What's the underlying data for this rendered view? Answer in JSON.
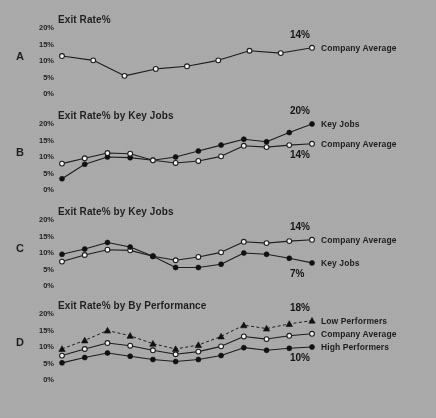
{
  "figure": {
    "background_color": "#a9a9a9",
    "ink_color": "#1d1d1d",
    "marker_open_fill": "#f2f2f2",
    "marker_solid_fill": "#101010"
  },
  "axis": {
    "ticks": [
      "20%",
      "15%",
      "10%",
      "5%",
      "0%"
    ],
    "ymin": 0,
    "ymax": 20
  },
  "panels": [
    {
      "letter": "A",
      "title": "Exit Rate%",
      "series_labels": [
        "Company Average"
      ],
      "end_values": [
        "14%"
      ]
    },
    {
      "letter": "B",
      "title": "Exit Rate% by Key Jobs",
      "series_labels": [
        "Key Jobs",
        "Company Average"
      ],
      "end_values": [
        "20%",
        "14%"
      ]
    },
    {
      "letter": "C",
      "title": "Exit Rate% by Key Jobs",
      "series_labels": [
        "Company Average",
        "Key Jobs"
      ],
      "end_values": [
        "14%",
        "7%"
      ]
    },
    {
      "letter": "D",
      "title": "Exit Rate% by By Performance",
      "series_labels": [
        "Low Performers",
        "Company Average",
        "High Performers"
      ],
      "end_values": [
        "18%",
        "10%"
      ]
    }
  ],
  "chart_data": [
    {
      "type": "line",
      "panel": "A",
      "title": "Exit Rate%",
      "xlabel": "",
      "ylabel": "Exit Rate%",
      "ylim": [
        0,
        20
      ],
      "yticks": [
        0,
        5,
        10,
        15,
        20
      ],
      "ytick_labels": [
        "0%",
        "5%",
        "10%",
        "15%",
        "20%"
      ],
      "grid": false,
      "legend_position": "right-inline",
      "x": [
        1,
        2,
        3,
        4,
        5,
        6,
        7,
        8,
        9
      ],
      "series": [
        {
          "name": "Company Average",
          "marker": "open-circle",
          "line_style": "solid",
          "end_label": "14%",
          "values": [
            11.5,
            10.2,
            5.5,
            7.6,
            8.4,
            10.2,
            13.1,
            12.4,
            14.0
          ]
        }
      ]
    },
    {
      "type": "line",
      "panel": "B",
      "title": "Exit Rate% by Key Jobs",
      "xlabel": "",
      "ylabel": "Exit Rate%",
      "ylim": [
        0,
        20
      ],
      "yticks": [
        0,
        5,
        10,
        15,
        20
      ],
      "ytick_labels": [
        "0%",
        "5%",
        "10%",
        "15%",
        "20%"
      ],
      "grid": false,
      "legend_position": "right-inline",
      "x": [
        1,
        2,
        3,
        4,
        5,
        6,
        7,
        8,
        9,
        10,
        11,
        12
      ],
      "series": [
        {
          "name": "Key Jobs",
          "marker": "solid-circle",
          "line_style": "solid",
          "end_label": "20%",
          "values": [
            3.4,
            7.8,
            10.0,
            9.8,
            9.0,
            10.0,
            11.8,
            13.6,
            15.4,
            14.6,
            17.4,
            20.0
          ]
        },
        {
          "name": "Company Average",
          "marker": "open-circle",
          "line_style": "solid",
          "end_label": "14%",
          "values": [
            8.0,
            9.6,
            11.2,
            11.0,
            9.0,
            8.2,
            8.8,
            10.2,
            13.4,
            13.0,
            13.6,
            14.0
          ]
        }
      ]
    },
    {
      "type": "line",
      "panel": "C",
      "title": "Exit Rate% by Key Jobs",
      "xlabel": "",
      "ylabel": "Exit Rate%",
      "ylim": [
        0,
        20
      ],
      "yticks": [
        0,
        5,
        10,
        15,
        20
      ],
      "ytick_labels": [
        "0%",
        "5%",
        "10%",
        "15%",
        "20%"
      ],
      "grid": false,
      "legend_position": "right-inline",
      "x": [
        1,
        2,
        3,
        4,
        5,
        6,
        7,
        8,
        9,
        10,
        11,
        12
      ],
      "series": [
        {
          "name": "Company Average",
          "marker": "open-circle",
          "line_style": "solid",
          "end_label": "14%",
          "values": [
            7.4,
            9.4,
            11.0,
            10.8,
            9.0,
            7.8,
            8.8,
            10.2,
            13.4,
            13.0,
            13.6,
            14.0
          ]
        },
        {
          "name": "Key Jobs",
          "marker": "solid-circle",
          "line_style": "solid",
          "end_label": "7%",
          "values": [
            9.6,
            11.2,
            13.2,
            11.8,
            9.0,
            5.6,
            5.6,
            6.6,
            10.0,
            9.6,
            8.4,
            7.0
          ]
        }
      ]
    },
    {
      "type": "line",
      "panel": "D",
      "title": "Exit Rate% by By Performance",
      "xlabel": "",
      "ylabel": "Exit Rate%",
      "ylim": [
        0,
        20
      ],
      "yticks": [
        0,
        5,
        10,
        15,
        20
      ],
      "ytick_labels": [
        "0%",
        "5%",
        "10%",
        "15%",
        "20%"
      ],
      "grid": false,
      "legend_position": "right-inline",
      "x": [
        1,
        2,
        3,
        4,
        5,
        6,
        7,
        8,
        9,
        10,
        11,
        12
      ],
      "series": [
        {
          "name": "Low Performers",
          "marker": "solid-triangle",
          "line_style": "dashed",
          "end_label": "18%",
          "values": [
            9.4,
            12.0,
            15.0,
            13.4,
            11.0,
            9.4,
            10.6,
            13.2,
            16.6,
            15.6,
            17.0,
            18.0
          ]
        },
        {
          "name": "Company Average",
          "marker": "open-circle",
          "line_style": "solid",
          "end_label": "",
          "values": [
            7.4,
            9.4,
            11.2,
            10.4,
            9.0,
            7.8,
            8.6,
            10.2,
            13.2,
            12.4,
            13.4,
            14.0
          ]
        },
        {
          "name": "High Performers",
          "marker": "solid-circle",
          "line_style": "solid",
          "end_label": "10%",
          "values": [
            5.2,
            6.8,
            8.2,
            7.2,
            6.2,
            5.6,
            6.2,
            7.4,
            9.8,
            9.0,
            9.6,
            10.0
          ]
        }
      ]
    }
  ]
}
